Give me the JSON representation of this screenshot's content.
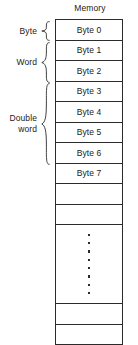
{
  "diagram": {
    "title": "Memory",
    "title_icon": "none",
    "accent_color": "#2b2b2b",
    "background_color": "#ffffff",
    "cells": [
      {
        "label": "Byte 0",
        "empty": false,
        "ellipsis": false
      },
      {
        "label": "Byte 1",
        "empty": false,
        "ellipsis": false
      },
      {
        "label": "Byte 2",
        "empty": false,
        "ellipsis": false
      },
      {
        "label": "Byte 3",
        "empty": false,
        "ellipsis": false
      },
      {
        "label": "Byte 4",
        "empty": false,
        "ellipsis": false
      },
      {
        "label": "Byte 5",
        "empty": false,
        "ellipsis": false
      },
      {
        "label": "Byte 6",
        "empty": false,
        "ellipsis": false
      },
      {
        "label": "Byte 7",
        "empty": false,
        "ellipsis": false
      },
      {
        "label": "",
        "empty": true,
        "ellipsis": false
      },
      {
        "label": "",
        "empty": true,
        "ellipsis": false
      },
      {
        "label": "",
        "empty": true,
        "ellipsis": true
      },
      {
        "label": "",
        "empty": true,
        "ellipsis": false
      },
      {
        "label": "",
        "empty": true,
        "ellipsis": false
      }
    ],
    "ellipsis_dot_count": 8,
    "braces": [
      {
        "label": "Byte",
        "spans_cells": 1,
        "first_cell": "Byte 0",
        "last_cell": "Byte 0",
        "icon": "curly-brace-icon"
      },
      {
        "label": "Word",
        "spans_cells": 2,
        "first_cell": "Byte 1",
        "last_cell": "Byte 2",
        "icon": "curly-brace-icon"
      },
      {
        "label": "Double word",
        "spans_cells": 4,
        "first_cell": "Byte 3",
        "last_cell": "Byte 6",
        "icon": "curly-brace-icon"
      }
    ]
  }
}
